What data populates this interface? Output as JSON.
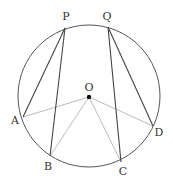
{
  "diagram": {
    "type": "circle-geometry",
    "circle": {
      "cx": 89,
      "cy": 96,
      "r": 71,
      "stroke": "#555555"
    },
    "center": {
      "id": "O",
      "x": 89,
      "y": 97,
      "label": "O",
      "label_x": 89,
      "label_y": 91
    },
    "points": [
      {
        "id": "P",
        "label": "P",
        "x": 65,
        "y": 28,
        "label_x": 66,
        "label_y": 20
      },
      {
        "id": "Q",
        "label": "Q",
        "x": 108,
        "y": 27,
        "label_x": 107,
        "label_y": 20
      },
      {
        "id": "A",
        "label": "A",
        "x": 23,
        "y": 117,
        "label_x": 15,
        "label_y": 124
      },
      {
        "id": "B",
        "label": "B",
        "x": 50,
        "y": 156,
        "label_x": 48,
        "label_y": 170
      },
      {
        "id": "C",
        "label": "C",
        "x": 121,
        "y": 162,
        "label_x": 123,
        "label_y": 175
      },
      {
        "id": "D",
        "label": "D",
        "x": 153,
        "y": 126,
        "label_x": 159,
        "label_y": 136
      }
    ],
    "chords": [
      {
        "from": "P",
        "to": "A",
        "color": "#444444"
      },
      {
        "from": "P",
        "to": "B",
        "color": "#444444"
      },
      {
        "from": "Q",
        "to": "C",
        "color": "#444444"
      },
      {
        "from": "Q",
        "to": "D",
        "color": "#444444"
      }
    ],
    "radii": [
      {
        "from": "O",
        "to": "A",
        "color": "#bbbbbb"
      },
      {
        "from": "O",
        "to": "B",
        "color": "#bbbbbb"
      },
      {
        "from": "O",
        "to": "C",
        "color": "#bbbbbb"
      },
      {
        "from": "O",
        "to": "D",
        "color": "#bbbbbb"
      }
    ]
  }
}
